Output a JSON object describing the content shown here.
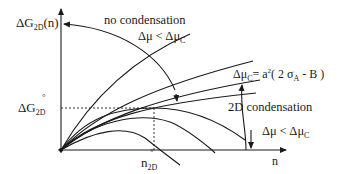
{
  "diagram": {
    "y_axis_label": {
      "main": "ΔG",
      "sub": "2D",
      "tail": "(n)"
    },
    "x_axis_label": "n",
    "dg_star": {
      "main": "ΔG",
      "sub": "2D",
      "mark": "°"
    },
    "n_star": {
      "main": "n",
      "sub": "2D",
      "mark": "°"
    },
    "annotations": {
      "no_condensation": "no condensation",
      "dmu_lt_top": {
        "a": "Δμ < Δμ",
        "sub": "C"
      },
      "critical": {
        "a": "Δμ",
        "sub": "C",
        "b": "= a",
        "sup": "2",
        "c": "( 2 σ",
        "sub2": "A",
        "d": " - B )"
      },
      "two_d_condensation": "2D condensation",
      "dmu_lt_bottom": {
        "a": "Δμ < Δμ",
        "sub": "C"
      }
    },
    "colors": {
      "ink": "#1a1a1a",
      "background": "#ffffff"
    }
  }
}
